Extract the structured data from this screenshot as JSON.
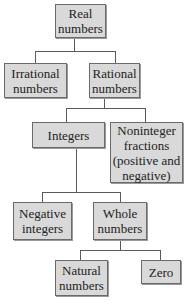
{
  "diagram": {
    "type": "hierarchy",
    "nodes": [
      {
        "id": "real",
        "label": "Real\nnumbers"
      },
      {
        "id": "irrational",
        "label": "Irrational\nnumbers"
      },
      {
        "id": "rational",
        "label": "Rational\nnumbers"
      },
      {
        "id": "integers",
        "label": "Integers"
      },
      {
        "id": "noninteger",
        "label": "Noninteger\nfractions\n(positive and\nnegative)"
      },
      {
        "id": "negative",
        "label": "Negative\nintegers"
      },
      {
        "id": "whole",
        "label": "Whole\nnumbers"
      },
      {
        "id": "natural",
        "label": "Natural\nnumbers"
      },
      {
        "id": "zero",
        "label": "Zero"
      }
    ],
    "edges": [
      [
        "real",
        "irrational"
      ],
      [
        "real",
        "rational"
      ],
      [
        "rational",
        "integers"
      ],
      [
        "rational",
        "noninteger"
      ],
      [
        "integers",
        "negative"
      ],
      [
        "integers",
        "whole"
      ],
      [
        "whole",
        "natural"
      ],
      [
        "whole",
        "zero"
      ]
    ],
    "colors": {
      "box_fill": "#d9d9d9",
      "border": "#6a6a6a",
      "line": "#5a5a5a"
    }
  }
}
